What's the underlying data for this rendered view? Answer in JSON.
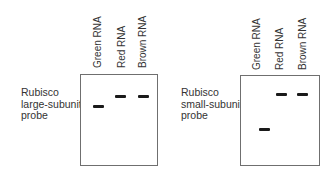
{
  "panels": [
    {
      "id": "large-subunit",
      "probe_label": [
        "Rubisco",
        "large-subunit",
        "probe"
      ],
      "lanes": [
        "Green RNA",
        "Red RNA",
        "Brown RNA"
      ],
      "bands": [
        {
          "lane": "Green RNA",
          "relative_position": "lower"
        },
        {
          "lane": "Red RNA",
          "relative_position": "upper"
        },
        {
          "lane": "Brown RNA",
          "relative_position": "upper"
        }
      ]
    },
    {
      "id": "small-subunit",
      "probe_label": [
        "Rubisco",
        "small-subunit",
        "probe"
      ],
      "lanes": [
        "Green RNA",
        "Red RNA",
        "Brown RNA"
      ],
      "bands": [
        {
          "lane": "Green RNA",
          "relative_position": "much lower"
        },
        {
          "lane": "Red RNA",
          "relative_position": "upper"
        },
        {
          "lane": "Brown RNA",
          "relative_position": "upper"
        }
      ]
    }
  ],
  "colors": {
    "band": "#1a1a1a",
    "border": "#6f6f6f",
    "text": "#333333"
  }
}
